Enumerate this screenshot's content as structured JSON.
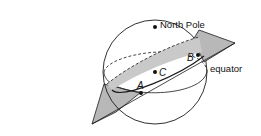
{
  "diagram": {
    "type": "sphere-with-great-circle-plane",
    "colors": {
      "background": "#ffffff",
      "stroke": "#1a1a1a",
      "plane_fill": "#b8b8b8",
      "great_circle_band": "#c9c9c9"
    },
    "labels": {
      "north_pole": "North Pole",
      "equator": "equator",
      "point_a": "A",
      "point_b": "B",
      "point_c": "C"
    },
    "points": [
      {
        "id": "north_pole",
        "label": "North Pole"
      },
      {
        "id": "A",
        "label": "A"
      },
      {
        "id": "B",
        "label": "B"
      },
      {
        "id": "C",
        "label": "C"
      }
    ]
  }
}
